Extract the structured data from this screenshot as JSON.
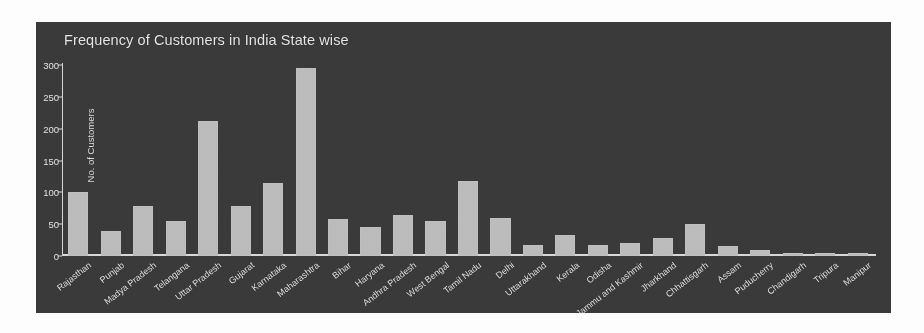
{
  "chart_data": {
    "type": "bar",
    "title": "Frequency of Customers in India State wise",
    "xlabel": "",
    "ylabel": "No. of Customers",
    "ylim": [
      0,
      300
    ],
    "yticks": [
      0,
      50,
      100,
      150,
      200,
      250,
      300
    ],
    "grid": false,
    "legend": "none",
    "bar_color": "#bcbcbc",
    "background_color": "#3a3a3a",
    "text_color": "#e6e6e6",
    "categories": [
      "Rajasthan",
      "Punjab",
      "Madya Pradesh",
      "Telangana",
      "Uttar Pradesh",
      "Gujarat",
      "Karnataka",
      "Maharashtra",
      "Bihar",
      "Haryana",
      "Andhra Pradesh",
      "West Bengal",
      "Tamil Nadu",
      "Delhi",
      "Uttarakhand",
      "Kerala",
      "Odisha",
      "Jammu and Kashmir",
      "Jharkhand",
      "Chhattisgarh",
      "Assam",
      "Puducherry",
      "Chandigarh",
      "Tripura",
      "Manipur"
    ],
    "values": [
      100,
      40,
      78,
      55,
      212,
      78,
      115,
      295,
      58,
      45,
      65,
      55,
      118,
      60,
      18,
      33,
      18,
      20,
      28,
      50,
      15,
      10,
      5,
      5,
      5
    ]
  }
}
